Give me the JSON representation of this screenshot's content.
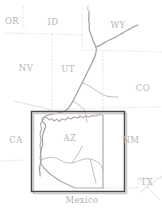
{
  "map": {
    "title": "Southwestern United States reference map",
    "width": 162,
    "height": 211,
    "background_color": "#ffffff",
    "state_labels": [
      {
        "id": "OR",
        "text": "OR",
        "x": 12,
        "y": 24
      },
      {
        "id": "ID",
        "text": "ID",
        "x": 53,
        "y": 25
      },
      {
        "id": "WY",
        "text": "WY",
        "x": 118,
        "y": 28
      },
      {
        "id": "NV",
        "text": "NV",
        "x": 26,
        "y": 71
      },
      {
        "id": "UT",
        "text": "UT",
        "x": 68,
        "y": 72
      },
      {
        "id": "CO",
        "text": "CO",
        "x": 140,
        "y": 91
      },
      {
        "id": "CA",
        "text": "CA",
        "x": 16,
        "y": 143
      },
      {
        "id": "AZ",
        "text": "AZ",
        "x": 70,
        "y": 141
      },
      {
        "id": "NM",
        "text": "NM",
        "x": 127,
        "y": 143
      },
      {
        "id": "TX",
        "text": "TX",
        "x": 145,
        "y": 185
      }
    ],
    "country_labels": [
      {
        "id": "Mexico",
        "text": "Mexico",
        "x": 82,
        "y": 203
      }
    ],
    "features": {
      "river_name": "Colorado River",
      "river_color": "#a79d9a",
      "state_border_color": "#e3d2d4",
      "label_color": "#b9b4b4"
    },
    "extent_box": {
      "name": "arizona-extent-box",
      "x": 31,
      "y": 111,
      "width": 93,
      "height": 80,
      "stroke_color": "#4a4a4a"
    }
  }
}
